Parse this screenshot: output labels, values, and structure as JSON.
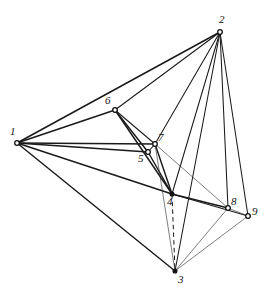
{
  "figure": {
    "title": "",
    "background_color": "#ffffff",
    "line_color": "#1a1a1a",
    "width": 275,
    "height": 295
  },
  "chart_data": {
    "type": "diagram",
    "subtype": "node-link-graph",
    "title": "",
    "xlabel": "",
    "ylabel": "",
    "grid": false,
    "legend": false,
    "node_count": 9,
    "edge_count": 26,
    "nodes": [
      {
        "id": "1",
        "label": "1",
        "x": 17,
        "y": 143,
        "label_x": 10,
        "label_y": 126,
        "marker": "open"
      },
      {
        "id": "2",
        "label": "2",
        "x": 220,
        "y": 32,
        "label_x": 219,
        "label_y": 14,
        "marker": "open"
      },
      {
        "id": "3",
        "label": "3",
        "x": 175,
        "y": 271,
        "label_x": 178,
        "label_y": 274,
        "marker": "solid"
      },
      {
        "id": "4",
        "label": "4",
        "x": 172,
        "y": 194,
        "label_x": 167,
        "label_y": 196,
        "marker": "solid"
      },
      {
        "id": "5",
        "label": "5",
        "x": 148,
        "y": 152,
        "label_x": 138,
        "label_y": 153,
        "marker": "open"
      },
      {
        "id": "6",
        "label": "6",
        "x": 115,
        "y": 110,
        "label_x": 105,
        "label_y": 95,
        "marker": "open"
      },
      {
        "id": "7",
        "label": "7",
        "x": 155,
        "y": 144,
        "label_x": 158,
        "label_y": 132,
        "marker": "open"
      },
      {
        "id": "8",
        "label": "8",
        "x": 228,
        "y": 208,
        "label_x": 231,
        "label_y": 196,
        "marker": "open"
      },
      {
        "id": "9",
        "label": "9",
        "x": 248,
        "y": 216,
        "label_x": 252,
        "label_y": 206,
        "marker": "open"
      }
    ],
    "edges": [
      {
        "from": "1",
        "to": "2",
        "style": "solid",
        "weight": "thick"
      },
      {
        "from": "1",
        "to": "6",
        "style": "solid",
        "weight": "thick"
      },
      {
        "from": "1",
        "to": "7",
        "style": "solid",
        "weight": "thick"
      },
      {
        "from": "1",
        "to": "5",
        "style": "solid",
        "weight": "thick"
      },
      {
        "from": "1",
        "to": "4",
        "style": "solid",
        "weight": "thick"
      },
      {
        "from": "1",
        "to": "3",
        "style": "solid",
        "weight": "thick"
      },
      {
        "from": "2",
        "to": "6",
        "style": "solid",
        "weight": "med"
      },
      {
        "from": "2",
        "to": "7",
        "style": "solid",
        "weight": "med"
      },
      {
        "from": "2",
        "to": "4",
        "style": "solid",
        "weight": "med"
      },
      {
        "from": "2",
        "to": "3",
        "style": "solid",
        "weight": "med"
      },
      {
        "from": "2",
        "to": "8",
        "style": "solid",
        "weight": "med"
      },
      {
        "from": "2",
        "to": "9",
        "style": "solid",
        "weight": "med"
      },
      {
        "from": "6",
        "to": "5",
        "style": "solid",
        "weight": "thick"
      },
      {
        "from": "6",
        "to": "7",
        "style": "solid",
        "weight": "med"
      },
      {
        "from": "6",
        "to": "4",
        "style": "solid",
        "weight": "thick"
      },
      {
        "from": "5",
        "to": "7",
        "style": "solid",
        "weight": "med"
      },
      {
        "from": "5",
        "to": "4",
        "style": "solid",
        "weight": "thick"
      },
      {
        "from": "7",
        "to": "4",
        "style": "solid",
        "weight": "thick"
      },
      {
        "from": "7",
        "to": "8",
        "style": "solid",
        "weight": "thin"
      },
      {
        "from": "7",
        "to": "3",
        "style": "solid",
        "weight": "thin"
      },
      {
        "from": "4",
        "to": "8",
        "style": "solid",
        "weight": "thick"
      },
      {
        "from": "4",
        "to": "9",
        "style": "solid",
        "weight": "med"
      },
      {
        "from": "4",
        "to": "3",
        "style": "dashed",
        "weight": "med"
      },
      {
        "from": "8",
        "to": "9",
        "style": "solid",
        "weight": "thin"
      },
      {
        "from": "8",
        "to": "3",
        "style": "solid",
        "weight": "thin"
      },
      {
        "from": "9",
        "to": "3",
        "style": "solid",
        "weight": "thin"
      }
    ]
  }
}
